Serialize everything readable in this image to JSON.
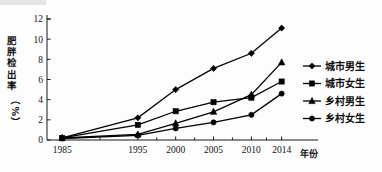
{
  "chart_data": {
    "type": "line",
    "title": "",
    "xlabel": "年份",
    "ylabel": "肥胖检出率（%）",
    "ylabel_chars": [
      "肥",
      "胖",
      "检",
      "出",
      "率",
      "（",
      "%",
      "）"
    ],
    "categories": [
      "1985",
      "1995",
      "2000",
      "2005",
      "2010",
      "2014"
    ],
    "x": [
      1985,
      1995,
      2000,
      2005,
      2010,
      2014
    ],
    "xlim": [
      1983.0,
      2015.5
    ],
    "ylim": [
      0,
      12
    ],
    "yticks": [
      "0",
      "2",
      "4",
      "6",
      "8",
      "10",
      "12"
    ],
    "ytick_values": [
      0,
      2,
      4,
      6,
      8,
      10,
      12
    ],
    "grid": false,
    "legend_position": "right",
    "series": [
      {
        "name": "城市男生",
        "marker": "diamond",
        "color": "#000000",
        "values": [
          0.2,
          2.2,
          5.0,
          7.1,
          8.6,
          11.1
        ]
      },
      {
        "name": "城市女生",
        "marker": "square",
        "color": "#000000",
        "values": [
          0.2,
          1.5,
          2.85,
          3.75,
          4.2,
          5.8
        ]
      },
      {
        "name": "乡村男生",
        "marker": "triangle",
        "color": "#000000",
        "values": [
          0.2,
          0.55,
          1.65,
          2.8,
          4.5,
          7.7
        ]
      },
      {
        "name": "乡村女生",
        "marker": "circle",
        "color": "#000000",
        "values": [
          0.15,
          0.45,
          1.15,
          1.75,
          2.5,
          4.6
        ]
      }
    ]
  },
  "legend": {
    "items": [
      {
        "label": "城市男生",
        "marker": "diamond"
      },
      {
        "label": "城市女生",
        "marker": "square"
      },
      {
        "label": "乡村男生",
        "marker": "triangle"
      },
      {
        "label": "乡村女生",
        "marker": "circle"
      }
    ]
  },
  "colors": {
    "ink": "#000000",
    "background": "#fdfdfd",
    "axis": "#1a1a1a"
  }
}
